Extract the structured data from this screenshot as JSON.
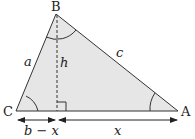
{
  "diagram": {
    "title": "",
    "vertices": {
      "A": {
        "label": "A",
        "x": 178,
        "y": 111
      },
      "B": {
        "label": "B",
        "x": 56,
        "y": 14
      },
      "C": {
        "label": "C",
        "x": 16,
        "y": 111
      }
    },
    "foot": {
      "x": 57,
      "y": 111
    },
    "sides": {
      "a": "a",
      "c": "c",
      "h": "h"
    },
    "dimensions": {
      "left": "b − x",
      "right": "x"
    },
    "colors": {
      "fill": "#e6e6e6",
      "stroke": "#333333",
      "text": "#222222"
    }
  }
}
